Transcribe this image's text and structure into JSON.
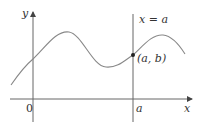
{
  "diagram": {
    "title": "",
    "labels": {
      "y_axis": "y",
      "x_axis": "x",
      "origin": "0",
      "a_tick": "a",
      "vertical_line": "x = a",
      "point": "(a, b)"
    },
    "colors": {
      "axis": "#555555",
      "curve": "#888888",
      "point": "#222222",
      "text": "#333333"
    }
  }
}
